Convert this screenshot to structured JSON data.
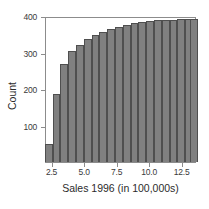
{
  "chart_data": {
    "type": "bar",
    "title": "",
    "subtitle": "",
    "xlabel": "Sales 1996 (in 100,000s)",
    "ylabel": "Count",
    "grid": false,
    "legend": null,
    "xlim": [
      2.0,
      13.6
    ],
    "ylim": [
      0,
      400
    ],
    "xticks": [
      "2.5",
      "5.0",
      "7.5",
      "10.0",
      "12.5"
    ],
    "xtick_values": [
      2.5,
      5.0,
      7.5,
      10.0,
      12.5
    ],
    "yticks": [
      "100",
      "200",
      "300",
      "400"
    ],
    "ytick_values": [
      100,
      200,
      300,
      400
    ],
    "bar_width": 0.6,
    "note": "cumulative histogram of sales",
    "x": [
      2.2,
      2.8,
      3.4,
      4.0,
      4.6,
      5.2,
      5.8,
      6.4,
      7.0,
      7.6,
      8.2,
      8.8,
      9.4,
      10.0,
      10.6,
      11.2,
      11.8,
      12.4,
      13.0,
      13.4
    ],
    "categories": [
      "2.2",
      "2.8",
      "3.4",
      "4.0",
      "4.6",
      "5.2",
      "5.8",
      "6.4",
      "7.0",
      "7.6",
      "8.2",
      "8.8",
      "9.4",
      "10.0",
      "10.6",
      "11.2",
      "11.8",
      "12.4",
      "13.0",
      "13.4"
    ],
    "values": [
      48,
      187,
      268,
      303,
      321,
      336,
      347,
      356,
      364,
      371,
      376,
      380,
      383,
      386,
      388,
      389,
      390,
      391,
      392,
      393
    ],
    "series": [
      {
        "name": "Cumulative count",
        "values": [
          48,
          187,
          268,
          303,
          321,
          336,
          347,
          356,
          364,
          371,
          376,
          380,
          383,
          386,
          388,
          389,
          390,
          391,
          392,
          393
        ]
      }
    ],
    "colors": {
      "bar_fill": "#808080",
      "bar_edge": "#4f4f4f",
      "axis": "#8c8c8c",
      "text": "#2b2b2b",
      "background": "#ffffff"
    }
  }
}
